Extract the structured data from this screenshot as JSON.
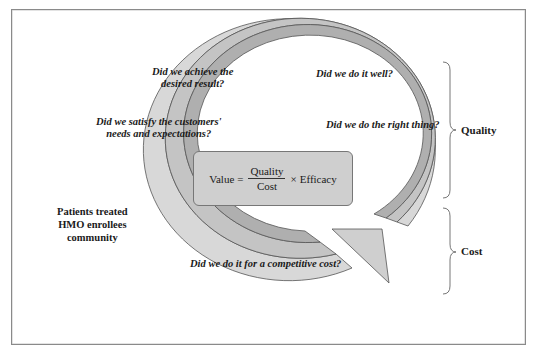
{
  "diagram": {
    "type": "cyclical-value-arrow",
    "formula": {
      "lhs": "Value",
      "equals": "=",
      "numerator": "Quality",
      "denominator": "Cost",
      "times": "×",
      "factor": "Efficacy"
    },
    "questions": [
      {
        "id": "achieve",
        "line1": "Did we achieve the",
        "line2": "desired result?"
      },
      {
        "id": "well",
        "line1": "Did we do it well?"
      },
      {
        "id": "satisfy",
        "line1": "Did we satisfy the customers'",
        "line2": "needs and expectations?"
      },
      {
        "id": "right",
        "line1": "Did we do the right thing?"
      },
      {
        "id": "cost",
        "line1": "Did we do it for a competitive cost?"
      }
    ],
    "population_labels": [
      "Patients treated",
      "HMO enrollees",
      "community"
    ],
    "brackets": [
      {
        "label": "Quality"
      },
      {
        "label": "Cost"
      }
    ],
    "colors": {
      "outer_band": "#d6d6d6",
      "middle_band": "#c2c2c2",
      "inner_band": "#acacac",
      "stroke": "#555555",
      "formula_box": "#cfcfcf"
    }
  }
}
